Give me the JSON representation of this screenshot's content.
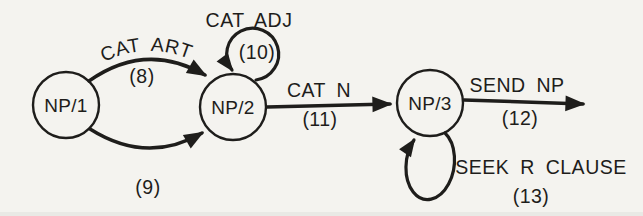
{
  "figure": {
    "type": "transition-network-diagram",
    "colors": {
      "paper": "#f4f3ef",
      "ink": "#1e1d1b"
    },
    "nodes": [
      {
        "label": "NP/1"
      },
      {
        "label": "NP/2"
      },
      {
        "label": "NP/3"
      }
    ],
    "edges": [
      {
        "from": "NP/1",
        "to": "NP/2",
        "shape": "arc-up",
        "label": "CAT ART",
        "number": "(8)"
      },
      {
        "from": "NP/1",
        "to": "NP/2",
        "shape": "arc-down",
        "label": "",
        "number": "(9)"
      },
      {
        "from": "NP/2",
        "to": "NP/2",
        "shape": "self-loop-top",
        "label": "CAT ADJ",
        "number": "(10)"
      },
      {
        "from": "NP/2",
        "to": "NP/3",
        "shape": "straight",
        "label": "CAT N",
        "number": "(11)"
      },
      {
        "from": "NP/3",
        "to": "exit",
        "shape": "straight",
        "label": "SEND NP",
        "number": "(12)"
      },
      {
        "from": "NP/3",
        "to": "NP/3",
        "shape": "self-loop-bottom",
        "label": "SEEK R CLAUSE",
        "number": "(13)"
      }
    ]
  }
}
